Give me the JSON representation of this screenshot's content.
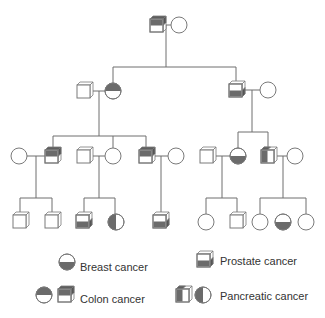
{
  "diagram": {
    "type": "pedigree",
    "colors": {
      "line": "#6e6e6e",
      "affected_fill": "#6b6b6b",
      "background": "#ffffff"
    },
    "generations": [
      {
        "id": "I",
        "individuals": [
          {
            "id": "I-1",
            "sex": "male",
            "condition": "colon cancer"
          },
          {
            "id": "I-2",
            "sex": "female",
            "condition": "none"
          }
        ]
      },
      {
        "id": "II",
        "individuals": [
          {
            "id": "II-1",
            "sex": "male",
            "condition": "none"
          },
          {
            "id": "II-2",
            "sex": "female",
            "condition": "breast cancer"
          },
          {
            "id": "II-3",
            "sex": "male",
            "condition": "prostate cancer"
          },
          {
            "id": "II-4",
            "sex": "female",
            "condition": "none"
          }
        ]
      },
      {
        "id": "III",
        "individuals": [
          {
            "id": "III-1",
            "sex": "female",
            "condition": "none"
          },
          {
            "id": "III-2",
            "sex": "male",
            "condition": "colon cancer"
          },
          {
            "id": "III-3",
            "sex": "male",
            "condition": "none"
          },
          {
            "id": "III-4",
            "sex": "female",
            "condition": "none"
          },
          {
            "id": "III-5",
            "sex": "male",
            "condition": "colon cancer"
          },
          {
            "id": "III-6",
            "sex": "female",
            "condition": "none"
          },
          {
            "id": "III-7",
            "sex": "male",
            "condition": "none"
          },
          {
            "id": "III-8",
            "sex": "female",
            "condition": "breast cancer"
          },
          {
            "id": "III-9",
            "sex": "male",
            "condition": "pancreatic cancer"
          },
          {
            "id": "III-10",
            "sex": "female",
            "condition": "none"
          }
        ]
      },
      {
        "id": "IV",
        "individuals": [
          {
            "id": "IV-1",
            "sex": "male",
            "condition": "none"
          },
          {
            "id": "IV-2",
            "sex": "male",
            "condition": "none"
          },
          {
            "id": "IV-3",
            "sex": "male",
            "condition": "prostate cancer"
          },
          {
            "id": "IV-4",
            "sex": "female",
            "condition": "pancreatic cancer"
          },
          {
            "id": "IV-5",
            "sex": "male",
            "condition": "prostate cancer"
          },
          {
            "id": "IV-6",
            "sex": "female",
            "condition": "none"
          },
          {
            "id": "IV-7",
            "sex": "male",
            "condition": "none"
          },
          {
            "id": "IV-8",
            "sex": "female",
            "condition": "none"
          },
          {
            "id": "IV-9",
            "sex": "female",
            "condition": "breast cancer"
          },
          {
            "id": "IV-10",
            "sex": "female",
            "condition": "none"
          }
        ]
      }
    ]
  },
  "legend": {
    "breast": "Breast cancer",
    "prostate": "Prostate cancer",
    "colon": "Colon cancer",
    "pancreatic": "Pancreatic cancer"
  }
}
